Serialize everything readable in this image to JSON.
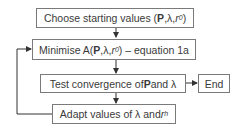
{
  "diagram": {
    "type": "flowchart",
    "nodes": [
      {
        "id": "choose",
        "parts": {
          "pre": "Choose starting values (",
          "bold": "P",
          "mid": ",λ,",
          "var": "r",
          "sub": "0",
          "post": ")"
        }
      },
      {
        "id": "minimise",
        "parts": {
          "pre": "Minimise A(",
          "bold": "P",
          "mid": ",λ,",
          "var": "r",
          "sub": "0",
          "post": ") – equation 1a"
        }
      },
      {
        "id": "test",
        "parts": {
          "pre": "Test convergence of ",
          "bold": "P",
          "post": " and λ"
        }
      },
      {
        "id": "end",
        "parts": {
          "label": "End"
        }
      },
      {
        "id": "adapt",
        "parts": {
          "pre": "Adapt values of λ and ",
          "var": "r",
          "sub": "h"
        }
      }
    ],
    "edges": [
      {
        "from": "choose",
        "to": "minimise"
      },
      {
        "from": "minimise",
        "to": "test"
      },
      {
        "from": "test",
        "to": "end"
      },
      {
        "from": "test",
        "to": "adapt"
      },
      {
        "from": "adapt",
        "to": "minimise",
        "style": "loop-left"
      }
    ],
    "colors": {
      "border": "#7a7a7a",
      "line": "#333333",
      "text": "#3a3a3a"
    }
  }
}
